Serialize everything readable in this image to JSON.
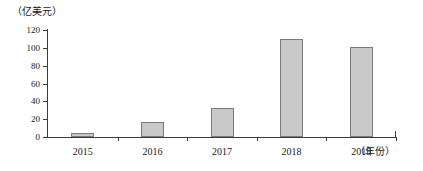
{
  "chart_data": {
    "type": "bar",
    "title": "",
    "subtitle": "",
    "xlabel": "（年份）",
    "ylabel": "（亿美元）",
    "categories": [
      "2015",
      "2016",
      "2017",
      "2018",
      "2019"
    ],
    "values": [
      5,
      17,
      33,
      110,
      101
    ],
    "series": [
      {
        "name": "",
        "values": [
          5,
          17,
          33,
          110,
          101
        ]
      }
    ],
    "ylim": [
      0,
      120
    ],
    "yticks": [
      0,
      20,
      40,
      60,
      80,
      100,
      120
    ],
    "ytick_labels": [
      "0",
      "20",
      "40",
      "60",
      "80",
      "100",
      "120"
    ],
    "grid": false,
    "legend": false,
    "legend_position": "none",
    "bar_color": "#c9c9c9",
    "bar_border_color": "#7a7a7a",
    "axis_color": "#3b3b3b",
    "background": "#ffffff",
    "annotations": []
  },
  "axes": {
    "y_unit_label": "（亿美元）",
    "x_unit_label": "（年份）"
  }
}
